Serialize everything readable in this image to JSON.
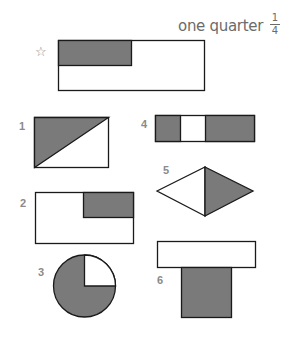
{
  "header": {
    "title": "one quarter",
    "fraction": {
      "numerator": "1",
      "denominator": "4"
    }
  },
  "example_marker": "☆",
  "colors": {
    "shade": "#7a7a7a",
    "stroke": "#1a1a1a",
    "label": "#8a8a8a"
  },
  "shapes": [
    {
      "id": "example",
      "label": "",
      "type": "rectangle",
      "shaded": "top-left quarter"
    },
    {
      "id": "1",
      "label": "1",
      "type": "rectangle",
      "shaded": "upper-left triangle (half)"
    },
    {
      "id": "2",
      "label": "2",
      "type": "rectangle",
      "shaded": "top-right quarter"
    },
    {
      "id": "3",
      "label": "3",
      "type": "circle",
      "shaded": "three quarters"
    },
    {
      "id": "4",
      "label": "4",
      "type": "strip",
      "shaded": "left quarter and right half"
    },
    {
      "id": "5",
      "label": "5",
      "type": "rhombus",
      "shaded": "right half"
    },
    {
      "id": "6",
      "label": "6",
      "type": "T-shape",
      "shaded": "bottom square"
    }
  ]
}
